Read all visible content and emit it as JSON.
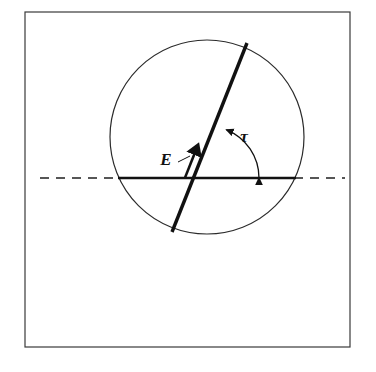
{
  "figure": {
    "title": "",
    "caption": "",
    "background_color": "#ffffff",
    "stroke_color": "#1a1a1a",
    "frame": {
      "name": "outer-border",
      "x": 25,
      "y": 12,
      "width": 325,
      "height": 335,
      "stroke_width": 1.2
    },
    "circle": {
      "name": "reference-circle",
      "center_x": 207,
      "center_y": 137,
      "radius": 97,
      "stroke_width": 1.2
    },
    "horizontal_axis": {
      "name": "horizontal-reference-line",
      "y": 178,
      "solid_start_x": 118,
      "solid_end_x": 296,
      "dash_left_start_x": 40,
      "dash_right_end_x": 345,
      "solid_stroke_width": 2.6,
      "dash_stroke_width": 1.6,
      "dash_pattern": "9 7"
    },
    "vector": {
      "name": "E-vector",
      "label": "E",
      "tail_x": 172,
      "tail_y": 232,
      "tip_x": 247,
      "tip_y": 43,
      "arrowhead_x": 196,
      "arrowhead_y": 150,
      "stroke_width": 3.4,
      "angle_deg": 68
    },
    "angle_arc": {
      "name": "tau-angle-arc",
      "label": "τ",
      "center_x": 207,
      "center_y": 178,
      "radius": 52,
      "start_angle_deg": 0,
      "end_angle_deg": 68,
      "double_headed": true,
      "stroke_width": 1.3
    },
    "labels": [
      {
        "name": "vector-label-E",
        "text": "E",
        "x": 166,
        "y": 165,
        "font_size": 17,
        "italic": true,
        "bold": true
      },
      {
        "name": "angle-label-tau",
        "text": "τ",
        "x": 244,
        "y": 142,
        "font_size": 17,
        "italic": true,
        "bold": true
      }
    ],
    "leader_line": {
      "name": "E-label-leader-line",
      "x1": 178,
      "y1": 162,
      "x2": 190,
      "y2": 156,
      "stroke_width": 1.0
    }
  }
}
